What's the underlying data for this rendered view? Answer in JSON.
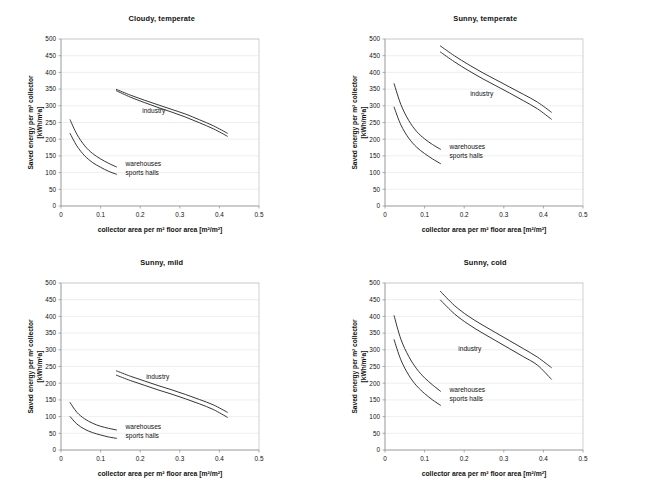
{
  "figure": {
    "panel_count": 4,
    "shared_xlabel": "collector area per m² floor area [m²/m²]",
    "shared_ylabel_line1": "Saved energy per m² collector",
    "shared_ylabel_line2": "[kWh/m²a]",
    "series_names": [
      "industry",
      "warehouses",
      "sports halls"
    ],
    "axis_color": "#9a9a9a",
    "grid_color": "#e3e3ea",
    "curve_color": "#2b2b2b",
    "background": "#ffffff"
  },
  "chart_data": [
    {
      "type": "line",
      "title": "Cloudy, temperate",
      "xlabel": "collector area per m² floor area [m²/m²]",
      "ylabel": "Saved energy per m² collector [kWh/m²a]",
      "xlim": [
        0,
        0.5
      ],
      "ylim": [
        0,
        500
      ],
      "xticks": [
        0,
        0.1,
        0.2,
        0.3,
        0.4,
        0.5
      ],
      "xticklabels": [
        "0",
        "0.1",
        "0.2",
        "0.3",
        "0.4",
        "0.5"
      ],
      "yticks": [
        0,
        50,
        100,
        150,
        200,
        250,
        300,
        350,
        400,
        450,
        500
      ],
      "yticklabels": [
        "0",
        "50",
        "100",
        "150",
        "200",
        "250",
        "300",
        "350",
        "400",
        "450",
        "500"
      ],
      "grid": "horizontal",
      "legend": "inline-annotations",
      "annotations": [
        {
          "text": "industry",
          "x": 0.205,
          "y": 278
        },
        {
          "text": "warehouses",
          "x": 0.163,
          "y": 120
        },
        {
          "text": "sports halls",
          "x": 0.163,
          "y": 92
        }
      ],
      "series": [
        {
          "name": "industry-upper",
          "label": "industry",
          "x": [
            0.14,
            0.175,
            0.21,
            0.245,
            0.28,
            0.315,
            0.35,
            0.385,
            0.42
          ],
          "values": [
            349,
            332,
            317,
            303,
            289,
            275,
            258,
            240,
            218
          ]
        },
        {
          "name": "industry-lower",
          "label": "industry",
          "x": [
            0.14,
            0.175,
            0.21,
            0.245,
            0.28,
            0.315,
            0.35,
            0.385,
            0.42
          ],
          "values": [
            345,
            326,
            310,
            295,
            281,
            266,
            249,
            231,
            209
          ]
        },
        {
          "name": "warehouses",
          "label": "warehouses",
          "x": [
            0.023,
            0.04,
            0.06,
            0.08,
            0.1,
            0.12,
            0.14
          ],
          "values": [
            258,
            215,
            180,
            157,
            141,
            128,
            117
          ]
        },
        {
          "name": "sports-halls",
          "label": "sports halls",
          "x": [
            0.023,
            0.04,
            0.06,
            0.08,
            0.1,
            0.12,
            0.14
          ],
          "values": [
            217,
            180,
            150,
            130,
            116,
            104,
            95
          ]
        }
      ]
    },
    {
      "type": "line",
      "title": "Sunny, temperate",
      "xlabel": "collector area per m² floor area [m²/m²]",
      "ylabel": "Saved energy per m² collector [kWh/m²a]",
      "xlim": [
        0,
        0.5
      ],
      "ylim": [
        0,
        500
      ],
      "xticks": [
        0,
        0.1,
        0.2,
        0.3,
        0.4,
        0.5
      ],
      "xticklabels": [
        "0",
        "0.1",
        "0.2",
        "0.3",
        "0.4",
        "0.5"
      ],
      "yticks": [
        0,
        50,
        100,
        150,
        200,
        250,
        300,
        350,
        400,
        450,
        500
      ],
      "yticklabels": [
        "0",
        "50",
        "100",
        "150",
        "200",
        "250",
        "300",
        "350",
        "400",
        "450",
        "500"
      ],
      "grid": "horizontal",
      "legend": "inline-annotations",
      "annotations": [
        {
          "text": "industry",
          "x": 0.215,
          "y": 330
        },
        {
          "text": "warehouses",
          "x": 0.163,
          "y": 172
        },
        {
          "text": "sports halls",
          "x": 0.163,
          "y": 143
        }
      ],
      "series": [
        {
          "name": "industry-upper",
          "label": "industry",
          "x": [
            0.14,
            0.175,
            0.21,
            0.245,
            0.28,
            0.315,
            0.35,
            0.385,
            0.42
          ],
          "values": [
            479,
            450,
            424,
            400,
            378,
            356,
            334,
            311,
            281
          ]
        },
        {
          "name": "industry-lower",
          "label": "industry",
          "x": [
            0.14,
            0.175,
            0.21,
            0.245,
            0.28,
            0.315,
            0.35,
            0.385,
            0.42
          ],
          "values": [
            461,
            432,
            406,
            382,
            360,
            338,
            315,
            291,
            260
          ]
        },
        {
          "name": "warehouses",
          "label": "warehouses",
          "x": [
            0.023,
            0.04,
            0.06,
            0.08,
            0.1,
            0.12,
            0.14
          ],
          "values": [
            366,
            304,
            256,
            223,
            201,
            184,
            170
          ]
        },
        {
          "name": "sports-halls",
          "label": "sports halls",
          "x": [
            0.023,
            0.04,
            0.06,
            0.08,
            0.1,
            0.12,
            0.14
          ],
          "values": [
            296,
            243,
            203,
            176,
            157,
            141,
            127
          ]
        }
      ]
    },
    {
      "type": "line",
      "title": "Sunny, mild",
      "xlabel": "collector area per m² floor area [m²/m²]",
      "ylabel": "Saved energy per m² collector [kWh/m²a]",
      "xlim": [
        0,
        0.5
      ],
      "ylim": [
        0,
        500
      ],
      "xticks": [
        0,
        0.1,
        0.2,
        0.3,
        0.4,
        0.5
      ],
      "xticklabels": [
        "0",
        "0.1",
        "0.2",
        "0.3",
        "0.4",
        "0.5"
      ],
      "yticks": [
        0,
        50,
        100,
        150,
        200,
        250,
        300,
        350,
        400,
        450,
        500
      ],
      "yticklabels": [
        "0",
        "50",
        "100",
        "150",
        "200",
        "250",
        "300",
        "350",
        "400",
        "450",
        "500"
      ],
      "grid": "horizontal",
      "legend": "inline-annotations",
      "annotations": [
        {
          "text": "industry",
          "x": 0.215,
          "y": 213
        },
        {
          "text": "warehouses",
          "x": 0.163,
          "y": 63
        },
        {
          "text": "sports halls",
          "x": 0.163,
          "y": 36
        }
      ],
      "series": [
        {
          "name": "industry-upper",
          "label": "industry",
          "x": [
            0.14,
            0.175,
            0.21,
            0.245,
            0.28,
            0.315,
            0.35,
            0.385,
            0.42
          ],
          "values": [
            237,
            221,
            207,
            193,
            180,
            166,
            151,
            135,
            113
          ]
        },
        {
          "name": "industry-lower",
          "label": "industry",
          "x": [
            0.14,
            0.175,
            0.21,
            0.245,
            0.28,
            0.315,
            0.35,
            0.385,
            0.42
          ],
          "values": [
            224,
            208,
            194,
            180,
            167,
            153,
            138,
            121,
            98
          ]
        },
        {
          "name": "warehouses",
          "label": "warehouses",
          "x": [
            0.023,
            0.04,
            0.06,
            0.08,
            0.1,
            0.12,
            0.14
          ],
          "values": [
            142,
            113,
            93,
            80,
            71,
            65,
            60
          ]
        },
        {
          "name": "sports-halls",
          "label": "sports halls",
          "x": [
            0.023,
            0.04,
            0.06,
            0.08,
            0.1,
            0.12,
            0.14
          ],
          "values": [
            100,
            78,
            62,
            52,
            45,
            39,
            35
          ]
        }
      ]
    },
    {
      "type": "line",
      "title": "Sunny, cold",
      "xlabel": "collector area per m² floor area [m²/m²]",
      "ylabel": "Saved energy per m² collector [kWh/m²a]",
      "xlim": [
        0,
        0.5
      ],
      "ylim": [
        0,
        500
      ],
      "xticks": [
        0,
        0.1,
        0.2,
        0.3,
        0.4,
        0.5
      ],
      "xticklabels": [
        "0",
        "0.1",
        "0.2",
        "0.3",
        "0.4",
        "0.5"
      ],
      "yticks": [
        0,
        50,
        100,
        150,
        200,
        250,
        300,
        350,
        400,
        450,
        500
      ],
      "yticklabels": [
        "0",
        "50",
        "100",
        "150",
        "200",
        "250",
        "300",
        "350",
        "400",
        "450",
        "500"
      ],
      "grid": "horizontal",
      "legend": "inline-annotations",
      "annotations": [
        {
          "text": "industry",
          "x": 0.185,
          "y": 296
        },
        {
          "text": "warehouses",
          "x": 0.163,
          "y": 174
        },
        {
          "text": "sports halls",
          "x": 0.163,
          "y": 147
        }
      ],
      "series": [
        {
          "name": "industry-upper",
          "label": "industry",
          "x": [
            0.14,
            0.175,
            0.21,
            0.245,
            0.28,
            0.315,
            0.35,
            0.385,
            0.42
          ],
          "values": [
            475,
            433,
            401,
            375,
            351,
            327,
            303,
            278,
            247
          ]
        },
        {
          "name": "industry-lower",
          "label": "industry",
          "x": [
            0.14,
            0.175,
            0.21,
            0.245,
            0.28,
            0.315,
            0.35,
            0.385,
            0.42
          ],
          "values": [
            449,
            408,
            377,
            351,
            327,
            303,
            279,
            254,
            212
          ]
        },
        {
          "name": "warehouses",
          "label": "warehouses",
          "x": [
            0.023,
            0.04,
            0.06,
            0.08,
            0.1,
            0.12,
            0.14
          ],
          "values": [
            402,
            332,
            280,
            243,
            216,
            195,
            176
          ]
        },
        {
          "name": "sports-halls",
          "label": "sports halls",
          "x": [
            0.023,
            0.04,
            0.06,
            0.08,
            0.1,
            0.12,
            0.14
          ],
          "values": [
            330,
            270,
            224,
            192,
            169,
            150,
            134
          ]
        }
      ]
    }
  ]
}
